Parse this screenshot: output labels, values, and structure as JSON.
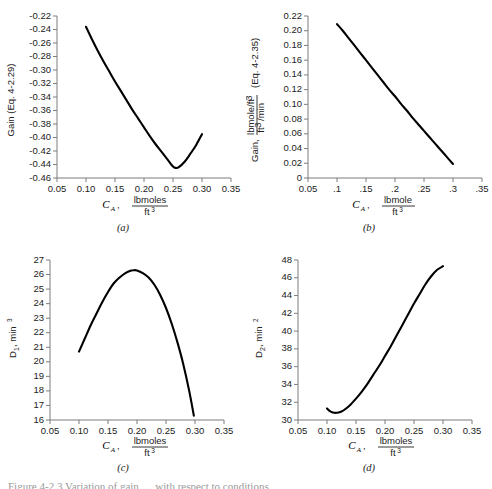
{
  "figure": {
    "caption_partial": "Figure 4-2.3  Variation of gain, ... with respect to conditions",
    "panel_letters": [
      "(a)",
      "(b)",
      "(c)",
      "(d)"
    ]
  },
  "chart_data": [
    {
      "id": "a",
      "type": "line",
      "title": "",
      "panel_letter": "(a)",
      "xlabel_var": "C",
      "xlabel_sub": "A",
      "xlabel_num": "lbmoles",
      "xlabel_den": "ft",
      "xlabel_den_sup": "3",
      "ylabel": "Gain (Eq. 4-2.29)",
      "xlim": [
        0.05,
        0.35
      ],
      "ylim": [
        -0.46,
        -0.22
      ],
      "xticks": [
        "0.05",
        "0.10",
        "0.15",
        "0.20",
        "0.25",
        "0.30",
        "0.35"
      ],
      "xtickvals": [
        0.05,
        0.1,
        0.15,
        0.2,
        0.25,
        0.3,
        0.35
      ],
      "yticks": [
        "-0.22",
        "-0.24",
        "-0.26",
        "-0.28",
        "-0.30",
        "-0.32",
        "-0.34",
        "-0.36",
        "-0.38",
        "-0.40",
        "-0.42",
        "-0.44",
        "-0.46"
      ],
      "ytickvals": [
        -0.22,
        -0.24,
        -0.26,
        -0.28,
        -0.3,
        -0.32,
        -0.34,
        -0.36,
        -0.38,
        -0.4,
        -0.42,
        -0.44,
        -0.46
      ],
      "grid": false,
      "legend": "none",
      "x": [
        0.1,
        0.11,
        0.12,
        0.13,
        0.14,
        0.15,
        0.16,
        0.17,
        0.18,
        0.19,
        0.2,
        0.21,
        0.22,
        0.23,
        0.24,
        0.25,
        0.255,
        0.26,
        0.27,
        0.28,
        0.29,
        0.3
      ],
      "y": [
        -0.236,
        -0.254,
        -0.271,
        -0.287,
        -0.302,
        -0.317,
        -0.331,
        -0.345,
        -0.359,
        -0.372,
        -0.385,
        -0.398,
        -0.41,
        -0.421,
        -0.432,
        -0.443,
        -0.445,
        -0.444,
        -0.436,
        -0.424,
        -0.411,
        -0.395
      ]
    },
    {
      "id": "b",
      "type": "line",
      "title": "",
      "panel_letter": "(b)",
      "xlabel_var": "C",
      "xlabel_sub": "A",
      "xlabel_num": "lbmole",
      "xlabel_den": "ft",
      "xlabel_den_sup": "3",
      "ylabel_prefix": "Gain,",
      "ylabel_num": "lbmole/ft",
      "ylabel_num_sup": "3",
      "ylabel_den": "ft",
      "ylabel_den_sup": "3",
      "ylabel_den_rest": "/min",
      "ylabel_suffix": "(Eq. 4-2.35)",
      "xlim": [
        0.05,
        0.35
      ],
      "ylim": [
        0,
        0.22
      ],
      "xticks": [
        "0.05",
        ".1",
        ".15",
        ".2",
        ".25",
        ".3",
        ".35"
      ],
      "xtickvals": [
        0.05,
        0.1,
        0.15,
        0.2,
        0.25,
        0.3,
        0.35
      ],
      "yticks": [
        "0",
        "0.02",
        "0.04",
        "0.06",
        "0.08",
        "0.10",
        "0.12",
        "0.14",
        "0.16",
        "0.18",
        "0.20",
        "0.22"
      ],
      "ytickvals": [
        0,
        0.02,
        0.04,
        0.06,
        0.08,
        0.1,
        0.12,
        0.14,
        0.16,
        0.18,
        0.2,
        0.22
      ],
      "grid": false,
      "legend": "none",
      "x": [
        0.1,
        0.11,
        0.12,
        0.13,
        0.14,
        0.15,
        0.16,
        0.17,
        0.18,
        0.19,
        0.2,
        0.21,
        0.22,
        0.23,
        0.24,
        0.25,
        0.26,
        0.27,
        0.28,
        0.29,
        0.3
      ],
      "y": [
        0.209,
        0.2,
        0.19,
        0.18,
        0.17,
        0.16,
        0.15,
        0.14,
        0.13,
        0.12,
        0.111,
        0.101,
        0.092,
        0.082,
        0.073,
        0.064,
        0.055,
        0.046,
        0.037,
        0.028,
        0.019
      ]
    },
    {
      "id": "c",
      "type": "line",
      "title": "",
      "panel_letter": "(c)",
      "xlabel_var": "C",
      "xlabel_sub": "A",
      "xlabel_num": "lbmoles",
      "xlabel_den": "ft",
      "xlabel_den_sup": "3",
      "ylabel_prefix": "D",
      "ylabel_sub": "1",
      "ylabel_rest": ", min",
      "ylabel_sup": "3",
      "xlim": [
        0.05,
        0.35
      ],
      "ylim": [
        16,
        27
      ],
      "xticks": [
        "0.05",
        "0.10",
        "0.15",
        "0.20",
        "0.25",
        "0.30",
        "0.35"
      ],
      "xtickvals": [
        0.05,
        0.1,
        0.15,
        0.2,
        0.25,
        0.3,
        0.35
      ],
      "yticks": [
        "16",
        "17",
        "18",
        "19",
        "20",
        "21",
        "22",
        "23",
        "24",
        "25",
        "26",
        "27"
      ],
      "ytickvals": [
        16,
        17,
        18,
        19,
        20,
        21,
        22,
        23,
        24,
        25,
        26,
        27
      ],
      "grid": false,
      "legend": "none",
      "x": [
        0.1,
        0.11,
        0.12,
        0.13,
        0.14,
        0.15,
        0.16,
        0.17,
        0.18,
        0.19,
        0.195,
        0.2,
        0.21,
        0.22,
        0.23,
        0.24,
        0.25,
        0.26,
        0.27,
        0.28,
        0.29,
        0.298
      ],
      "y": [
        20.7,
        21.6,
        22.5,
        23.3,
        24.1,
        24.8,
        25.4,
        25.8,
        26.1,
        26.27,
        26.3,
        26.28,
        26.1,
        25.8,
        25.3,
        24.6,
        23.7,
        22.6,
        21.3,
        19.8,
        18.0,
        16.3
      ]
    },
    {
      "id": "d",
      "type": "line",
      "title": "",
      "panel_letter": "(d)",
      "xlabel_var": "C",
      "xlabel_sub": "A",
      "xlabel_num": "lbmoles",
      "xlabel_den": "ft",
      "xlabel_den_sup": "3",
      "ylabel_prefix": "D",
      "ylabel_sub": "2",
      "ylabel_rest": ", min",
      "ylabel_sup": "2",
      "xlim": [
        0.05,
        0.35
      ],
      "ylim": [
        30,
        48
      ],
      "xticks": [
        "0.05",
        "0.10",
        "0.15",
        "0.20",
        "0.25",
        "0.30",
        "0.35"
      ],
      "xtickvals": [
        0.05,
        0.1,
        0.15,
        0.2,
        0.25,
        0.3,
        0.35
      ],
      "yticks": [
        "30",
        "32",
        "34",
        "36",
        "38",
        "40",
        "42",
        "44",
        "46",
        "48"
      ],
      "ytickvals": [
        30,
        32,
        34,
        36,
        38,
        40,
        42,
        44,
        46,
        48
      ],
      "grid": false,
      "legend": "none",
      "x": [
        0.1,
        0.105,
        0.11,
        0.115,
        0.12,
        0.125,
        0.13,
        0.14,
        0.15,
        0.16,
        0.17,
        0.18,
        0.19,
        0.2,
        0.21,
        0.22,
        0.23,
        0.24,
        0.25,
        0.26,
        0.27,
        0.28,
        0.29,
        0.3
      ],
      "y": [
        31.3,
        31.0,
        30.85,
        30.8,
        30.85,
        30.95,
        31.15,
        31.7,
        32.4,
        33.2,
        34.1,
        35.1,
        36.1,
        37.2,
        38.3,
        39.5,
        40.7,
        41.9,
        43.1,
        44.2,
        45.3,
        46.2,
        46.9,
        47.3
      ]
    }
  ]
}
